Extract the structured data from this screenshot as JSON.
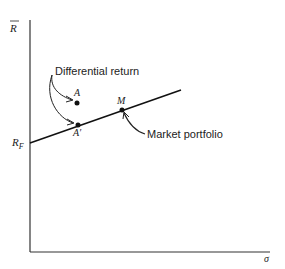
{
  "axes": {
    "y_label": "R",
    "x_label": "σ",
    "intercept_label": "R",
    "intercept_sub": "F"
  },
  "points": {
    "a": "A",
    "a_prime": "A′",
    "m": "M"
  },
  "annotations": {
    "differential_return": "Differential return",
    "market_portfolio": "Market portfolio"
  },
  "colors": {
    "ink": "#222222"
  }
}
